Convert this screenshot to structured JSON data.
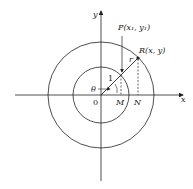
{
  "diagram": {
    "labels": {
      "y_axis": "y",
      "x_axis": "x",
      "point_p": "P(x₁, y₁)",
      "point_r": "R(x, y)",
      "radius_r": "r",
      "unit_radius": "1",
      "angle": "θ",
      "origin": "0",
      "point_m": "M",
      "point_n": "N"
    },
    "colors": {
      "ink": "#222222",
      "background": "#ffffff"
    }
  }
}
